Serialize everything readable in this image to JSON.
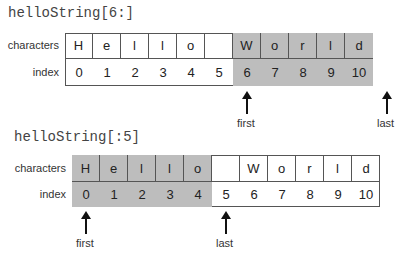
{
  "diagrams": [
    {
      "code": "helloString[6:]",
      "row_labels": {
        "characters": "characters",
        "index": "index"
      },
      "characters": [
        "H",
        "e",
        "l",
        "l",
        "o",
        "",
        "W",
        "o",
        "r",
        "l",
        "d"
      ],
      "indices": [
        "0",
        "1",
        "2",
        "3",
        "4",
        "5",
        "6",
        "7",
        "8",
        "9",
        "10"
      ],
      "shaded_from": 6,
      "shaded_to": 11,
      "pointers": [
        {
          "label": "first",
          "at_index": 6
        },
        {
          "label": "last",
          "at_index": 11
        }
      ]
    },
    {
      "code": "helloString[:5]",
      "row_labels": {
        "characters": "characters",
        "index": "index"
      },
      "characters": [
        "H",
        "e",
        "l",
        "l",
        "o",
        "",
        "W",
        "o",
        "r",
        "l",
        "d"
      ],
      "indices": [
        "0",
        "1",
        "2",
        "3",
        "4",
        "5",
        "6",
        "7",
        "8",
        "9",
        "10"
      ],
      "shaded_from": 0,
      "shaded_to": 5,
      "pointers": [
        {
          "label": "first",
          "at_index": 0
        },
        {
          "label": "last",
          "at_index": 5
        }
      ]
    }
  ],
  "colors": {
    "shade": "#bdbdbd",
    "border": "#555555"
  }
}
